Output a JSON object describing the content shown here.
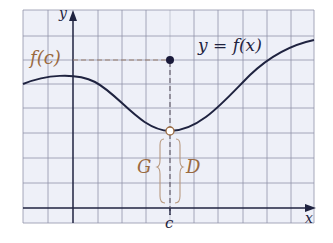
{
  "figure": {
    "y_axis_label": "y",
    "x_axis_label": "x",
    "fc_label": "f(c)",
    "curve_label": "y = f(x)",
    "c_label": "c",
    "left_label": "G",
    "right_label": "D"
  },
  "colors": {
    "grid_bg": "#eef0f8",
    "grid_line": "#8f93a8",
    "axis": "#1f2340",
    "curve": "#1f2340",
    "dash": "#9a8070",
    "brace": "#b89a80",
    "label_brown": "#9a6a40",
    "dot": "#1a1a3a"
  }
}
